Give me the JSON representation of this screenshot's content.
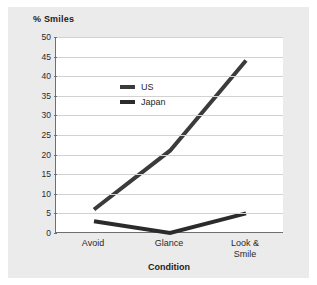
{
  "figure": {
    "background_color": "#ebebeb",
    "plot_background_color": "#ffffff",
    "axis_color": "#6f6f6f",
    "gridline_color": "#d2d2d2"
  },
  "chart_data": {
    "type": "line",
    "title": "",
    "ylabel": "% Smiles",
    "xlabel": "Condition",
    "categories": [
      "Avoid",
      "Glance",
      "Look &\nSmile"
    ],
    "ylim": [
      0,
      50
    ],
    "ytick_labels": [
      "50",
      "45",
      "40",
      "35",
      "30",
      "25",
      "20",
      "15",
      "10",
      "5",
      "0"
    ],
    "ytick_values": [
      50,
      45,
      40,
      35,
      30,
      25,
      20,
      15,
      10,
      5,
      0
    ],
    "grid": true,
    "legend_position": "upper-left-inside",
    "series": [
      {
        "name": "US",
        "color": "#3b3b3b",
        "values": [
          6,
          21,
          44
        ]
      },
      {
        "name": "Japan",
        "color": "#2b2b2b",
        "values": [
          3,
          0,
          5
        ]
      }
    ]
  },
  "legend": {
    "items": [
      {
        "label": "US",
        "color": "#3b3b3b"
      },
      {
        "label": "Japan",
        "color": "#2b2b2b"
      }
    ]
  }
}
